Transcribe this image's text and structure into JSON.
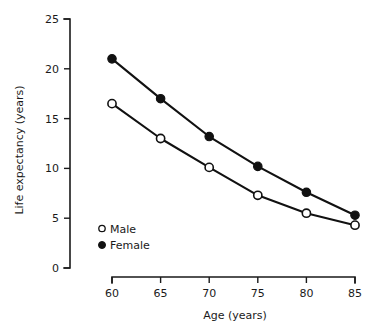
{
  "chart_data": {
    "type": "line",
    "title": "",
    "subtitle": "",
    "xlabel": "Age (years)",
    "ylabel": "Life expectancy (years)",
    "x": [
      60,
      65,
      70,
      75,
      80,
      85
    ],
    "xtick_labels": [
      "60",
      "65",
      "70",
      "75",
      "80",
      "85"
    ],
    "ytick_labels": [
      "0",
      "5",
      "10",
      "15",
      "20",
      "25"
    ],
    "yticks": [
      0,
      5,
      10,
      15,
      20,
      25
    ],
    "xlim": [
      60,
      85
    ],
    "ylim": [
      0,
      25
    ],
    "grid": false,
    "legend_position": "inside-lower-left",
    "series": [
      {
        "name": "Male",
        "marker": "open-circle",
        "color": "#111111",
        "values": [
          16.5,
          13.0,
          10.1,
          7.3,
          5.5,
          4.3
        ]
      },
      {
        "name": "Female",
        "marker": "filled-circle",
        "color": "#111111",
        "values": [
          21.0,
          17.0,
          13.2,
          10.2,
          7.6,
          5.3
        ]
      }
    ],
    "legend": [
      {
        "label": "Male",
        "marker": "open-circle"
      },
      {
        "label": "Female",
        "marker": "filled-circle"
      }
    ]
  }
}
